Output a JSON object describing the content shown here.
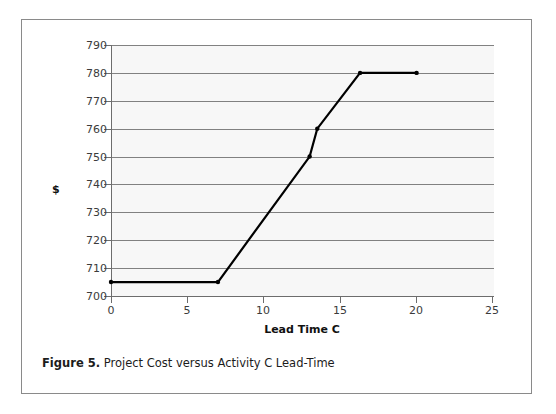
{
  "figure": {
    "caption_label": "Figure 5.",
    "caption_text": "Project Cost versus Activity C Lead-Time"
  },
  "chart_data": {
    "type": "line",
    "title": "",
    "xlabel": "Lead Time C",
    "ylabel": "$",
    "xlim": [
      0,
      25
    ],
    "ylim": [
      700,
      790
    ],
    "xticks": [
      0,
      5,
      10,
      15,
      20,
      25
    ],
    "xtick_labels": [
      "0",
      "5",
      "10",
      "15",
      "20",
      "25"
    ],
    "yticks": [
      700,
      710,
      720,
      730,
      740,
      750,
      760,
      770,
      780,
      790
    ],
    "ytick_labels": [
      "700",
      "710",
      "720",
      "730",
      "740",
      "750",
      "760",
      "770",
      "780",
      "790"
    ],
    "grid": "horizontal",
    "legend": "none",
    "series": [
      {
        "name": "Project Cost",
        "color": "#000000",
        "marker": "dot",
        "x": [
          0,
          7,
          13,
          13.5,
          16.3,
          20
        ],
        "y": [
          705,
          705,
          750,
          760,
          780,
          780
        ],
        "points": [
          {
            "x": 0,
            "y": 705
          },
          {
            "x": 7,
            "y": 705
          },
          {
            "x": 13,
            "y": 750
          },
          {
            "x": 13.5,
            "y": 760
          },
          {
            "x": 16.3,
            "y": 780
          },
          {
            "x": 20,
            "y": 780
          }
        ]
      }
    ]
  },
  "colors": {
    "frame_border": "#8a8a8a",
    "plot_background": "#f7f7f7",
    "gridline": "#818181",
    "axis": "#6d6d6d",
    "series_line": "#000000",
    "tick_text": "#3b3b3b"
  }
}
